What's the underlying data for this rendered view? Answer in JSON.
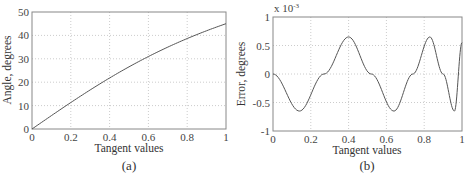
{
  "chart_data": [
    {
      "type": "line",
      "caption": "(a)",
      "title": "",
      "xlabel": "Tangent values",
      "ylabel": "Angle, degrees",
      "xlim": [
        0,
        1
      ],
      "ylim": [
        0,
        50
      ],
      "xticks": [
        "0",
        "0.2",
        "0.4",
        "0.6",
        "0.8",
        "1"
      ],
      "yticks": [
        "0",
        "10",
        "20",
        "30",
        "40",
        "50"
      ],
      "grid": true,
      "series": [
        {
          "name": "atan(x) in degrees",
          "x": [
            0,
            0.1,
            0.2,
            0.3,
            0.4,
            0.5,
            0.6,
            0.7,
            0.8,
            0.9,
            1.0
          ],
          "y": [
            0,
            5.71,
            11.31,
            16.7,
            21.8,
            26.57,
            30.96,
            34.99,
            38.66,
            41.99,
            45.0
          ]
        }
      ]
    },
    {
      "type": "line",
      "caption": "(b)",
      "title": "",
      "xlabel": "Tangent values",
      "ylabel": "Error, degrees",
      "y_multiplier": "x 10^-3",
      "xlim": [
        0,
        1
      ],
      "ylim": [
        -1,
        1
      ],
      "xticks": [
        "0",
        "0.2",
        "0.4",
        "0.6",
        "0.8",
        "1"
      ],
      "yticks": [
        "-1",
        "-0.5",
        "0",
        "0.5",
        "1"
      ],
      "grid": true,
      "series": [
        {
          "name": "approximation error",
          "x": [
            0,
            0.14,
            0.27,
            0.4,
            0.52,
            0.64,
            0.74,
            0.83,
            0.9,
            0.96,
            1.0
          ],
          "y": [
            0,
            -0.65,
            0,
            0.65,
            0,
            -0.65,
            0,
            0.65,
            0,
            -0.65,
            0.55
          ]
        }
      ]
    }
  ],
  "panels": {
    "a": {
      "caption": "(a)",
      "xlabel": "Tangent values",
      "ylabel": "Angle, degrees"
    },
    "b": {
      "caption": "(b)",
      "xlabel": "Tangent values",
      "ylabel": "Error, degrees",
      "multiplier_base": "x 10",
      "multiplier_exp": "-3"
    }
  }
}
